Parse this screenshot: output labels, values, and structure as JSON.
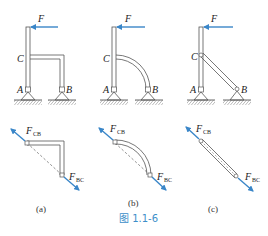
{
  "figure": {
    "caption": "图 1.1-6",
    "caption_color": "#3d8fc9",
    "force_color": "#3a86c8",
    "line_color": "#555555"
  },
  "panels": [
    {
      "id": "a",
      "label": "(a)",
      "member_shape": "right-angle bracket",
      "top_labels": {
        "force": "F",
        "point_c": "C",
        "point_a": "A",
        "point_b": "B"
      },
      "fbd_labels": {
        "f_cb": "F",
        "f_cb_sub": "CB",
        "f_bc": "F",
        "f_bc_sub": "BC"
      }
    },
    {
      "id": "b",
      "label": "(b)",
      "member_shape": "quarter arc",
      "top_labels": {
        "force": "F",
        "point_c": "C",
        "point_a": "A",
        "point_b": "B"
      },
      "fbd_labels": {
        "f_cb": "F",
        "f_cb_sub": "CB",
        "f_bc": "F",
        "f_bc_sub": "BC"
      }
    },
    {
      "id": "c",
      "label": "(c)",
      "member_shape": "straight diagonal bar",
      "top_labels": {
        "force": "F",
        "point_c": "C",
        "point_a": "A",
        "point_b": "B"
      },
      "fbd_labels": {
        "f_cb": "F",
        "f_cb_sub": "CB",
        "f_bc": "F",
        "f_bc_sub": "BC"
      }
    }
  ]
}
